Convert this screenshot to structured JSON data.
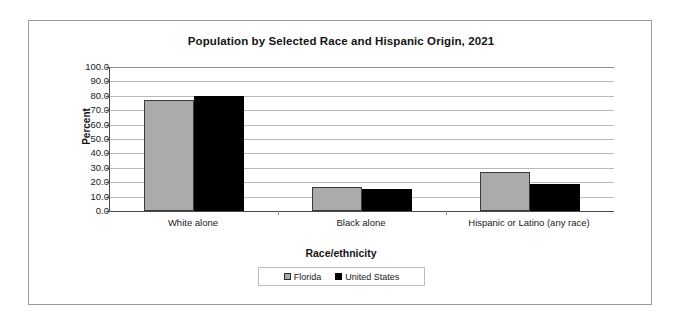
{
  "chart_data": {
    "type": "bar",
    "title": "Population by Selected Race and Hispanic Origin, 2021",
    "xlabel": "Race/ethnicity",
    "ylabel": "Percent",
    "categories": [
      "White alone",
      "Black alone",
      "Hispanic or Latino (any race)"
    ],
    "series": [
      {
        "name": "Florida",
        "values": [
          77.0,
          17.0,
          27.0
        ],
        "color": "#ababab"
      },
      {
        "name": "United States",
        "values": [
          80.0,
          15.0,
          19.0
        ],
        "color": "#000000"
      }
    ],
    "ylim": [
      0.0,
      100.0
    ],
    "ytick_step": 10.0,
    "ytick_labels": [
      "100.0",
      "90.0",
      "80.0",
      "70.0",
      "60.0",
      "50.0",
      "40.0",
      "30.0",
      "20.0",
      "10.0",
      "0.0"
    ],
    "grid": true,
    "legend_position": "bottom"
  }
}
